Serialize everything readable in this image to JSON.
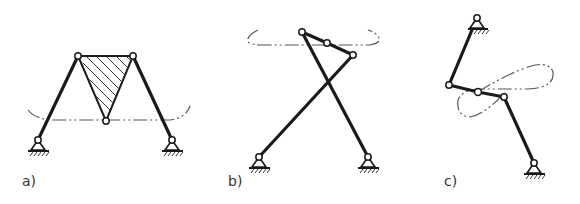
{
  "figure": {
    "colors": {
      "ink": "#1a1a1a",
      "curve": "#555555",
      "background": "#ffffff"
    },
    "panels": [
      {
        "id": "a",
        "label": "a)",
        "type": "four-bar linkage with triangular coupler"
      },
      {
        "id": "b",
        "label": "b)",
        "type": "crossed four-bar linkage"
      },
      {
        "id": "c",
        "label": "c)",
        "type": "four-bar linkage with figure-eight coupler curve"
      }
    ]
  }
}
